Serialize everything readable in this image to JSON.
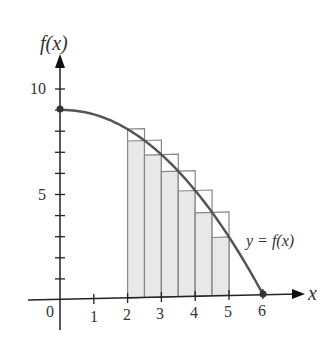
{
  "chart_data": {
    "type": "area",
    "title": "",
    "function": "f(x) = 9 - x^2/4",
    "curve_label": "y = f(x)",
    "xlabel": "x",
    "ylabel": "f(x)",
    "x_ticks": [
      "0",
      "1",
      "2",
      "3",
      "4",
      "5",
      "6"
    ],
    "y_tick_labels": [
      {
        "value": 5,
        "label": "5"
      },
      {
        "value": 10,
        "label": "10"
      }
    ],
    "xlim": [
      0,
      6.5
    ],
    "ylim": [
      0,
      11
    ],
    "interval": [
      2,
      5
    ],
    "n_subintervals": 6,
    "subinterval_width": 0.5,
    "upper_rectangles_left_endpoint": [
      {
        "x": [
          2.0,
          2.5
        ],
        "height": 8.0
      },
      {
        "x": [
          2.5,
          3.0
        ],
        "height": 7.44
      },
      {
        "x": [
          3.0,
          3.5
        ],
        "height": 6.75
      },
      {
        "x": [
          3.5,
          4.0
        ],
        "height": 5.94
      },
      {
        "x": [
          4.0,
          4.5
        ],
        "height": 5.0
      },
      {
        "x": [
          4.5,
          5.0
        ],
        "height": 3.94
      }
    ],
    "lower_rectangles_right_endpoint": [
      {
        "x": [
          2.0,
          2.5
        ],
        "height": 7.44
      },
      {
        "x": [
          2.5,
          3.0
        ],
        "height": 6.75
      },
      {
        "x": [
          3.0,
          3.5
        ],
        "height": 5.94
      },
      {
        "x": [
          3.5,
          4.0
        ],
        "height": 5.0
      },
      {
        "x": [
          4.0,
          4.5
        ],
        "height": 3.94
      },
      {
        "x": [
          4.5,
          5.0
        ],
        "height": 2.75
      }
    ],
    "points": [
      {
        "x": 0,
        "y": 9
      },
      {
        "x": 6,
        "y": 0
      }
    ],
    "grid": false,
    "colors": {
      "curve": "#555555",
      "axis": "#222222",
      "rect_fill": "#e8e8e8",
      "rect_stroke": "#888888"
    }
  },
  "labels": {
    "y_axis": "f(x)",
    "x_axis": "x",
    "origin": "0",
    "curve": "y = f(x)",
    "x1": "1",
    "x2": "2",
    "x3": "3",
    "x4": "4",
    "x5": "5",
    "x6": "6",
    "y5": "5",
    "y10": "10"
  }
}
